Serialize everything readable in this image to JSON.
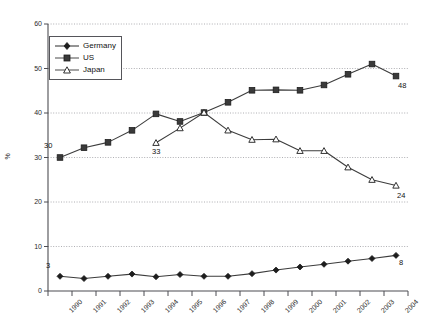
{
  "chart_data": {
    "type": "line",
    "title": "",
    "xlabel": "",
    "ylabel": "%",
    "ylim": [
      0,
      60
    ],
    "yticks": [
      0,
      10,
      20,
      30,
      40,
      50,
      60
    ],
    "grid": true,
    "legend_position": "top-left",
    "categories": [
      "1990",
      "1991",
      "1992",
      "1993",
      "1994",
      "1995",
      "1996",
      "1997",
      "1998",
      "1999",
      "2000",
      "2001",
      "2002",
      "2003",
      "2004"
    ],
    "series": [
      {
        "name": "Germany",
        "marker": "diamond",
        "values": [
          3.3,
          2.8,
          3.3,
          3.8,
          3.2,
          3.7,
          3.3,
          3.3,
          3.9,
          4.7,
          5.4,
          6.0,
          6.7,
          7.3,
          8.0
        ]
      },
      {
        "name": "US",
        "marker": "square",
        "values": [
          30.0,
          32.2,
          33.4,
          36.1,
          39.8,
          38.1,
          40.1,
          42.4,
          45.1,
          45.2,
          45.1,
          46.3,
          48.7,
          51.0,
          48.3
        ]
      },
      {
        "name": "Japan",
        "marker": "triangle",
        "values": [
          null,
          null,
          null,
          null,
          33.3,
          36.6,
          40.1,
          36.1,
          34.0,
          34.1,
          31.5,
          31.5,
          27.8,
          25.0,
          23.7
        ]
      }
    ],
    "annotations": [
      {
        "text": "30",
        "series": "US",
        "category": "1990",
        "value": 30.0
      },
      {
        "text": "48",
        "series": "US",
        "category": "2004",
        "value": 48.3
      },
      {
        "text": "33",
        "series": "Japan",
        "category": "1994",
        "value": 33.3
      },
      {
        "text": "24",
        "series": "Japan",
        "category": "2004",
        "value": 23.7
      },
      {
        "text": "3",
        "series": "Germany",
        "category": "1990",
        "value": 3.3
      },
      {
        "text": "8",
        "series": "Germany",
        "category": "2004",
        "value": 8.0
      }
    ],
    "colors": {
      "germany": "#2b2b2b",
      "us": "#4a4a4a",
      "japan": "#4a4a4a",
      "axis": "#4d4d52",
      "grid": "#9a9aa0",
      "background": "#ffffff"
    }
  },
  "legend": {
    "items": [
      {
        "label": "Germany"
      },
      {
        "label": "US"
      },
      {
        "label": "Japan"
      }
    ]
  },
  "axes": {
    "y_title": "%",
    "y_tick_labels": [
      "0",
      "10",
      "20",
      "30",
      "40",
      "50",
      "60"
    ],
    "x_tick_labels": [
      "1990",
      "1991",
      "1992",
      "1993",
      "1994",
      "1995",
      "1996",
      "1997",
      "1998",
      "1999",
      "2000",
      "2001",
      "2002",
      "2003",
      "2004"
    ]
  }
}
